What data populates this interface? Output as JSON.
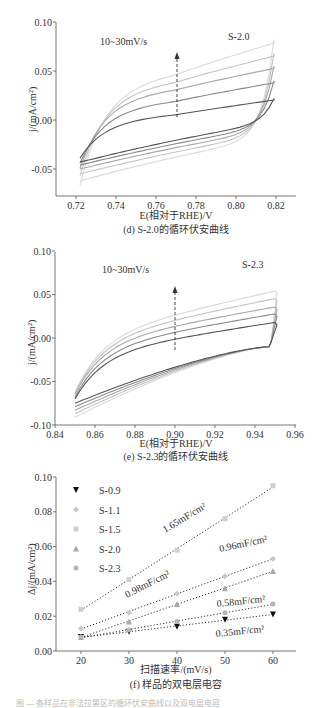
{
  "chart_data": [
    {
      "id": "d",
      "type": "line",
      "title": "(d) S-2.0的循环伏安曲线",
      "xlabel": "E(相对于RHE)/V",
      "ylabel": "j/(mA/cm²)",
      "xlim": [
        0.71,
        0.83
      ],
      "ylim": [
        -0.08,
        0.1
      ],
      "xticks": [
        "0.72",
        "0.74",
        "0.76",
        "0.78",
        "0.80",
        "0.82"
      ],
      "yticks": [
        "0.10",
        "0.05",
        "0.00",
        "-0.05"
      ],
      "annotations": [
        "10~30mV/s",
        "S-2.0"
      ],
      "arrow": "increasing scan rate (up)",
      "series": [
        {
          "name": "10mV/s",
          "upper_at_0.77": 0.006,
          "upper_end": 0.022,
          "lower_start": -0.043
        },
        {
          "name": "15mV/s",
          "upper_at_0.77": 0.02,
          "upper_end": 0.04,
          "lower_start": -0.046
        },
        {
          "name": "20mV/s",
          "upper_at_0.77": 0.032,
          "upper_end": 0.055,
          "lower_start": -0.05
        },
        {
          "name": "25mV/s",
          "upper_at_0.77": 0.04,
          "upper_end": 0.068,
          "lower_start": -0.055
        },
        {
          "name": "30mV/s",
          "upper_at_0.77": 0.048,
          "upper_end": 0.082,
          "lower_start": -0.062
        }
      ]
    },
    {
      "id": "e",
      "type": "line",
      "title": "(e) S-2.3的循环伏安曲线",
      "xlabel": "E(相对于RHE)/V",
      "ylabel": "j/(mA/cm²)",
      "xlim": [
        0.84,
        0.96
      ],
      "ylim": [
        -0.1,
        0.1
      ],
      "xticks": [
        "0.84",
        "0.86",
        "0.88",
        "0.90",
        "0.92",
        "0.94",
        "0.96"
      ],
      "yticks": [
        "0.10",
        "0.05",
        "0.00",
        "-0.05",
        "-0.10"
      ],
      "annotations": [
        "10~30mV/s",
        "S-2.3"
      ],
      "arrow": "increasing scan rate (up)",
      "series": [
        {
          "name": "10mV/s",
          "upper_at_0.90": 0.0,
          "upper_end": 0.02,
          "lower_start": -0.075
        },
        {
          "name": "15mV/s",
          "upper_at_0.90": 0.008,
          "upper_end": 0.03,
          "lower_start": -0.078
        },
        {
          "name": "20mV/s",
          "upper_at_0.90": 0.015,
          "upper_end": 0.038,
          "lower_start": -0.081
        },
        {
          "name": "25mV/s",
          "upper_at_0.90": 0.022,
          "upper_end": 0.048,
          "lower_start": -0.084
        },
        {
          "name": "30mV/s",
          "upper_at_0.90": 0.028,
          "upper_end": 0.057,
          "lower_start": -0.087
        }
      ]
    },
    {
      "id": "f",
      "type": "scatter",
      "title": "(f) 样品的双电层电容",
      "xlabel": "扫描速率/(mV/s)",
      "ylabel": "Δj/(mA/cm²)",
      "xlim": [
        15,
        65
      ],
      "ylim": [
        0.0,
        0.1
      ],
      "xticks": [
        "20",
        "30",
        "40",
        "50",
        "60"
      ],
      "yticks": [
        "0.10",
        "0.08",
        "0.06",
        "0.04",
        "0.02",
        "0.00"
      ],
      "legend_position": "upper left",
      "x": [
        20,
        30,
        40,
        50,
        60
      ],
      "series": [
        {
          "name": "S-0.9",
          "marker": "triangle-down",
          "color": "#111111",
          "values": [
            0.008,
            0.011,
            0.014,
            0.018,
            0.021
          ],
          "slope_label": "0.35mF/cm²"
        },
        {
          "name": "S-1.1",
          "marker": "diamond",
          "color": "#c8c8c8",
          "values": [
            0.013,
            0.022,
            0.033,
            0.043,
            0.053
          ],
          "slope_label": "0.98mF/cm²"
        },
        {
          "name": "S-1.5",
          "marker": "square",
          "color": "#cfcfcf",
          "values": [
            0.024,
            0.041,
            0.058,
            0.076,
            0.095
          ],
          "slope_label": "1.65mF/cm²"
        },
        {
          "name": "S-2.0",
          "marker": "triangle-up",
          "color": "#a8a8a8",
          "values": [
            0.008,
            0.017,
            0.027,
            0.036,
            0.046
          ],
          "slope_label": "0.96mF/cm²"
        },
        {
          "name": "S-2.3",
          "marker": "circle",
          "color": "#b5b5b5",
          "values": [
            0.008,
            0.012,
            0.017,
            0.022,
            0.027
          ],
          "slope_label": "0.58mF/cm²"
        }
      ]
    }
  ],
  "footer_text": "图 — 各样品在非法拉第区的循环伏安曲线以及双电层电容"
}
